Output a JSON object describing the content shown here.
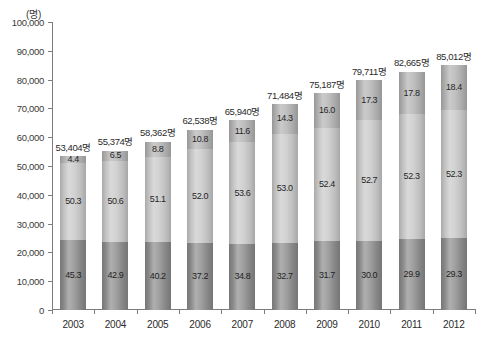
{
  "chart_data": {
    "type": "bar",
    "stacked": true,
    "title": "",
    "subtitle": "",
    "xlabel": "",
    "ylabel": "",
    "unit_label": "(명)",
    "ylim": [
      0,
      100000
    ],
    "ytick_step": 10000,
    "ytick_labels": [
      "100,000",
      "90,000",
      "80,000",
      "70,000",
      "60,000",
      "50,000",
      "40,000",
      "30,000",
      "20,000",
      "10,000",
      "0"
    ],
    "ytick_values": [
      100000,
      90000,
      80000,
      70000,
      60000,
      50000,
      40000,
      30000,
      20000,
      10000,
      0
    ],
    "grid": false,
    "legend": "none",
    "categories": [
      "2003",
      "2004",
      "2005",
      "2006",
      "2007",
      "2008",
      "2009",
      "2010",
      "2011",
      "2012"
    ],
    "totals": [
      53404,
      55374,
      58362,
      62538,
      65940,
      71484,
      75187,
      79711,
      82665,
      85012
    ],
    "total_labels": [
      "53,404명",
      "55,374명",
      "58,362명",
      "62,538명",
      "65,940명",
      "71,484명",
      "75,187명",
      "79,711명",
      "82,665명",
      "85,012명"
    ],
    "series": [
      {
        "name": "top-segment",
        "color": "#b4b4b4",
        "values": [
          4.4,
          6.5,
          8.8,
          10.8,
          11.6,
          14.3,
          16.0,
          17.3,
          17.8,
          18.4
        ],
        "labels": [
          "4.4",
          "6.5",
          "8.8",
          "10.8",
          "11.6",
          "14.3",
          "16.0",
          "17.3",
          "17.8",
          "18.4"
        ]
      },
      {
        "name": "middle-segment",
        "color": "#c9c9c9",
        "values": [
          50.3,
          50.6,
          51.1,
          52.0,
          53.6,
          53.0,
          52.4,
          52.7,
          52.3,
          52.3
        ],
        "labels": [
          "50.3",
          "50.6",
          "51.1",
          "52.0",
          "53.6",
          "53.0",
          "52.4",
          "52.7",
          "52.3",
          "52.3"
        ]
      },
      {
        "name": "bottom-segment",
        "color": "#8d8d8d",
        "values": [
          45.3,
          42.9,
          40.2,
          37.2,
          34.8,
          32.7,
          31.7,
          30.0,
          29.9,
          29.3
        ],
        "labels": [
          "45.3",
          "42.9",
          "40.2",
          "37.2",
          "34.8",
          "32.7",
          "31.7",
          "30.0",
          "29.9",
          "29.3"
        ]
      }
    ]
  }
}
